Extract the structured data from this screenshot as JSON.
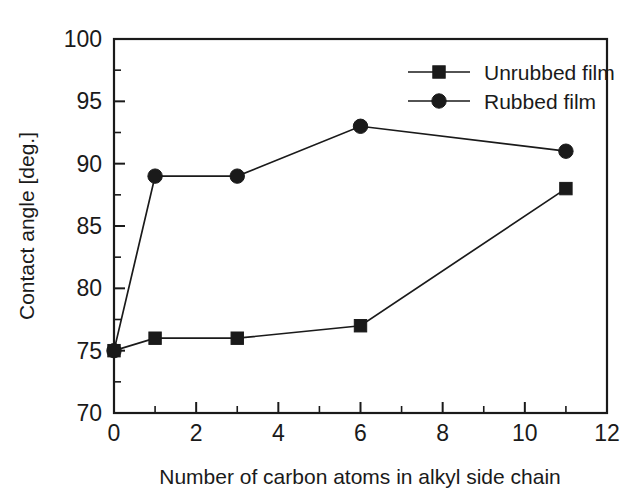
{
  "chart_data": {
    "type": "line",
    "title": "",
    "xlabel": "Number of carbon atoms in alkyl side chain",
    "ylabel": "Contact angle [deg.]",
    "xlim": [
      0,
      12
    ],
    "ylim": [
      70,
      100
    ],
    "xticks": [
      0,
      2,
      4,
      6,
      8,
      10,
      12
    ],
    "xtick_labels": [
      "0",
      "2",
      "4",
      "6",
      "8",
      "10",
      "12"
    ],
    "yticks": [
      70,
      75,
      80,
      85,
      90,
      95,
      100
    ],
    "ytick_labels": [
      "70",
      "75",
      "80",
      "85",
      "90",
      "95",
      "100"
    ],
    "x_minor_ticks": [
      1,
      3,
      5,
      7,
      9,
      11
    ],
    "y_minor_ticks": [
      72.5,
      77.5,
      82.5,
      87.5,
      92.5,
      97.5
    ],
    "grid": false,
    "legend_position": "top-right",
    "series": [
      {
        "name": "Unrubbed film",
        "marker": "square",
        "color": "#1a1a1a",
        "x": [
          0,
          1,
          3,
          6,
          11
        ],
        "values": [
          75,
          76,
          76,
          77,
          88
        ]
      },
      {
        "name": "Rubbed film",
        "marker": "circle",
        "color": "#1a1a1a",
        "x": [
          0,
          1,
          3,
          6,
          11
        ],
        "values": [
          75,
          89,
          89,
          93,
          91
        ]
      }
    ]
  },
  "legend": {
    "items": [
      {
        "label": "Unrubbed film",
        "marker": "square"
      },
      {
        "label": "Rubbed film",
        "marker": "circle"
      }
    ]
  },
  "axes": {
    "x_title": "Number of carbon atoms in alkyl side chain",
    "y_title": "Contact angle [deg.]"
  }
}
